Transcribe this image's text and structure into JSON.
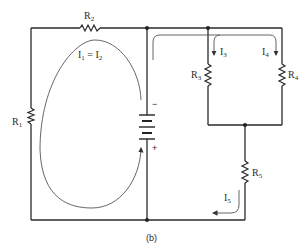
{
  "diagram": {
    "caption": "(b)",
    "resistors": [
      {
        "id": "R1",
        "base": "R",
        "sub": "1"
      },
      {
        "id": "R2",
        "base": "R",
        "sub": "2"
      },
      {
        "id": "R3",
        "base": "R",
        "sub": "3"
      },
      {
        "id": "R4",
        "base": "R",
        "sub": "4"
      },
      {
        "id": "R5",
        "base": "R",
        "sub": "5"
      }
    ],
    "battery": {
      "minus": "−",
      "plus": "+"
    },
    "currents": {
      "loop": {
        "a_base": "I",
        "a_sub": "1",
        "eq": " = ",
        "b_base": "I",
        "b_sub": "2"
      },
      "i3": {
        "base": "I",
        "sub": "3"
      },
      "i4": {
        "base": "I",
        "sub": "4"
      },
      "i5": {
        "base": "I",
        "sub": "5"
      }
    },
    "colors": {
      "wire": "#2a2a2a",
      "flow": "#555555"
    }
  }
}
